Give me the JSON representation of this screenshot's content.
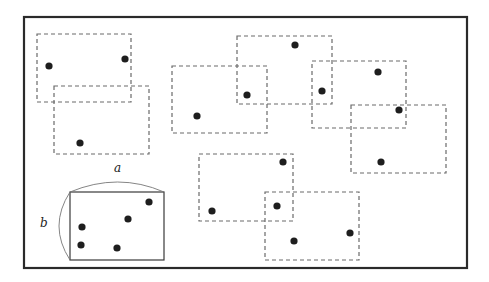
{
  "diagram": {
    "labels": {
      "width": "a",
      "height": "b"
    },
    "colors": {
      "frame": "#2a2a2a",
      "dashed": "#6a6a6a",
      "dot": "#1e1e1e"
    },
    "dashed_rectangle_count": 8,
    "point_count": 15,
    "reference_rectangle_point_count": 5
  }
}
